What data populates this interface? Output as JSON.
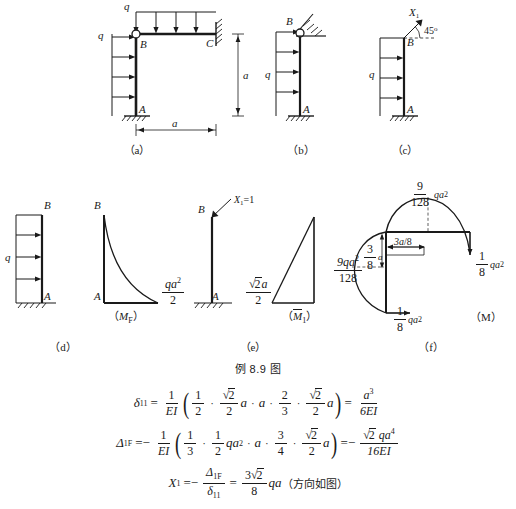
{
  "figure": {
    "caption": "例 8.9 图",
    "panels": [
      {
        "id": "a",
        "sublabel": "（a）",
        "joint_labels": [
          "B",
          "C",
          "A"
        ],
        "load_labels": [
          "q",
          "q"
        ],
        "dim_labels": [
          "a",
          "a"
        ],
        "description": "frame with hinge at B, fixed support at A, fixed support at C"
      },
      {
        "id": "b",
        "sublabel": "（b）",
        "joint_labels": [
          "B",
          "A"
        ],
        "load_labels": [
          "q"
        ],
        "description": "column with inclined roller support at B and fixed base at A"
      },
      {
        "id": "c",
        "sublabel": "（c）",
        "joint_labels": [
          "B",
          "A"
        ],
        "load_labels": [
          "q"
        ],
        "force_label": "X",
        "force_sub": "1",
        "angle_label": "45°",
        "description": "primary system with redundant force X1 at 45 degrees"
      },
      {
        "id": "d",
        "sublabel": "（d）",
        "joint_labels": [
          "B",
          "A"
        ],
        "load_labels": [
          "q"
        ],
        "diagram_name": "（M",
        "diagram_sub": "F",
        "diagram_close": "）",
        "value_num": "qa",
        "value_sup": "2",
        "value_den": "2",
        "value_labels": [
          "B",
          "A"
        ],
        "description": "load applied column and its MP bending moment diagram"
      },
      {
        "id": "e",
        "sublabel": "（e）",
        "joint_labels": [
          "B",
          "A"
        ],
        "force_label": "X",
        "force_sub": "1",
        "force_eq": "=1",
        "diagram_name": "（M",
        "diagram_over": "1",
        "diagram_close": "）",
        "value_rad": "√2",
        "value_a": "a",
        "value_den": "2",
        "description": "unit force diagram M1 bar"
      },
      {
        "id": "f",
        "sublabel": "（f）",
        "diagram_name": "（M）",
        "labels": {
          "top_num": "9",
          "top_den": "128",
          "top_tail": "qa",
          "top_sup": "2",
          "left_num": "9qa",
          "left_num_sup": "2",
          "left_den": "128",
          "dim_horizontal": "3a/8",
          "dim_vertical_num": "3",
          "dim_vertical_den": "8",
          "dim_vertical_tail": "a",
          "right_num": "1",
          "right_den": "8",
          "right_tail": "qa",
          "right_sup": "2",
          "bottom_num": "1",
          "bottom_den": "8",
          "bottom_tail": "qa",
          "bottom_sup": "2"
        },
        "description": "final bending moment diagram M"
      }
    ]
  },
  "equations": {
    "eq1": {
      "lhs_sym": "δ",
      "lhs_sub": "11",
      "eq": "=",
      "coef_num": "1",
      "coef_den": "EI",
      "open": "(",
      "t1_num": "1",
      "t1_den": "2",
      "t2_num": "√2",
      "t2_den": "2",
      "t2_tail": "a",
      "t3": "a",
      "t4_num": "2",
      "t4_den": "3",
      "t5_num": "√2",
      "t5_den": "2",
      "t5_tail": "a",
      "close": ")",
      "res_eq": "=",
      "res_num": "a",
      "res_sup": "3",
      "res_den": "6EI"
    },
    "eq2": {
      "lhs_sym": "Δ",
      "lhs_sub": "1F",
      "eq": "=−",
      "coef_num": "1",
      "coef_den": "EI",
      "open": "(",
      "t1_num": "1",
      "t1_den": "3",
      "t2_num": "1",
      "t2_den": "2",
      "t2_tail": "qa",
      "t2_sup": "2",
      "t3": "a",
      "t4_num": "3",
      "t4_den": "4",
      "t5_num": "√2",
      "t5_den": "2",
      "t5_tail": "a",
      "close": ")",
      "res_eq": "=−",
      "res_num": "√2 qa",
      "res_sup": "4",
      "res_den": "16EI"
    },
    "eq3": {
      "lhs_sym": "X",
      "lhs_sub": "1",
      "eq": "=−",
      "f1_num_sym": "Δ",
      "f1_num_sub": "1F",
      "f1_den_sym": "δ",
      "f1_den_sub": "11",
      "res_eq": "=",
      "res_num": "3√2",
      "res_den": "8",
      "res_tail": "qa",
      "note": "（方向如图）"
    }
  },
  "colors": {
    "ink": "#1a1a1a",
    "background": "#ffffff"
  }
}
